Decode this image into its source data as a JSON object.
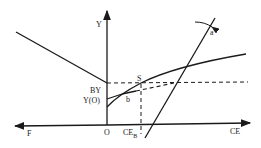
{
  "diagram": {
    "labels": {
      "y_axis": "Y",
      "x_axis_right": "CE",
      "x_axis_left": "F",
      "origin": "O",
      "by": "BY",
      "yo": "Y(O)",
      "s": "S",
      "b": "b",
      "a": "a",
      "ce_b_main": "CE",
      "ce_b_sub": "B"
    },
    "colors": {
      "line": "#1a1a1a",
      "background": "#ffffff"
    }
  }
}
